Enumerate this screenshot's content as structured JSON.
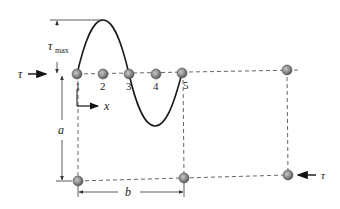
{
  "labels": {
    "tau_left": "τ",
    "tau_right": "τ",
    "tau_max_main": "τ",
    "tau_max_sub": "max",
    "x_axis": "x",
    "dim_a": "a",
    "dim_b": "b"
  },
  "particles": {
    "top": [
      {
        "num": "1",
        "x": 77,
        "y": 74
      },
      {
        "num": "2",
        "x": 103,
        "y": 74
      },
      {
        "num": "3",
        "x": 129,
        "y": 74
      },
      {
        "num": "4",
        "x": 156,
        "y": 74
      },
      {
        "num": "5",
        "x": 182,
        "y": 73
      },
      {
        "num": "",
        "x": 287,
        "y": 70
      }
    ],
    "bottom": [
      {
        "x": 78,
        "y": 181
      },
      {
        "x": 184,
        "y": 178
      },
      {
        "x": 288,
        "y": 175
      }
    ]
  },
  "colors": {
    "particle_fill": "#8a8a8a",
    "particle_stroke": "#555555",
    "wave": "#1a1a1a",
    "dashed": "#555555",
    "dimension": "#333333"
  }
}
